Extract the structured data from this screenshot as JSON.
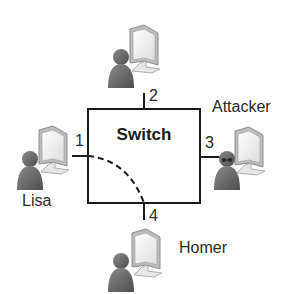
{
  "diagram": {
    "switch": {
      "label": "Switch"
    },
    "ports": [
      {
        "id": "1",
        "label": "1"
      },
      {
        "id": "2",
        "label": "2"
      },
      {
        "id": "3",
        "label": "3"
      },
      {
        "id": "4",
        "label": "4"
      }
    ],
    "hosts": [
      {
        "name": "Lisa",
        "port": "1",
        "icon": "user-computer-icon"
      },
      {
        "name": "",
        "port": "2",
        "icon": "user-computer-icon"
      },
      {
        "name": "Attacker",
        "port": "3",
        "icon": "masked-user-computer-icon"
      },
      {
        "name": "Homer",
        "port": "4",
        "icon": "user-computer-icon"
      }
    ],
    "connections": [
      {
        "from": "1",
        "to": "4",
        "style": "dashed",
        "description": "traffic path Lisa to Homer"
      }
    ],
    "colors": {
      "line": "#1a1a1a",
      "person": "#6b6b6b",
      "monitor_frame": "#cfcfcf",
      "screen": "#f4f4f4"
    }
  }
}
